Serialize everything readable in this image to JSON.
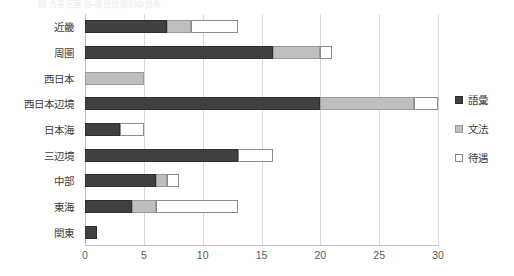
{
  "caption": {
    "text": "図 方言区画別・項目分類別の分布"
  },
  "chart_data": {
    "type": "bar",
    "orientation": "horizontal",
    "stacked": true,
    "title": "",
    "xlabel": "",
    "ylabel": "",
    "xlim": [
      0,
      30
    ],
    "ylim": null,
    "grid": true,
    "legend_position": "right",
    "tick_labels": [
      "0",
      "5",
      "10",
      "15",
      "20",
      "25",
      "30"
    ],
    "ticks": [
      0,
      5,
      10,
      15,
      20,
      25,
      30
    ],
    "categories": [
      "近畿",
      "周圏",
      "西日本",
      "西日本辺境",
      "日本海",
      "三辺境",
      "中部",
      "東海",
      "関東"
    ],
    "series": [
      {
        "name": "語彙",
        "color": "#404040",
        "values": [
          7,
          16,
          0,
          20,
          3,
          13,
          6,
          4,
          1
        ]
      },
      {
        "name": "文法",
        "color": "#bfbfbf",
        "values": [
          2,
          4,
          5,
          8,
          0,
          0,
          1,
          2,
          0
        ]
      },
      {
        "name": "待遇",
        "color": "#ffffff",
        "values": [
          4,
          1,
          0,
          2,
          2,
          3,
          1,
          7,
          0
        ]
      }
    ],
    "totals": [
      13,
      21,
      5,
      30,
      5,
      16,
      8,
      13,
      1
    ]
  }
}
